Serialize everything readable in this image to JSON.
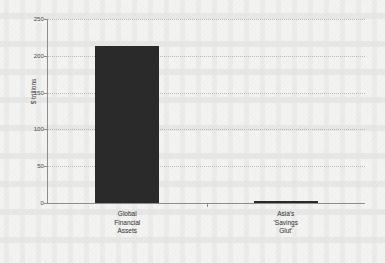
{
  "chart_data": {
    "type": "bar",
    "title": "",
    "subtitle": "",
    "xlabel": "",
    "ylabel": "$ trillions",
    "ylim": [
      0,
      250
    ],
    "yticks": [
      0,
      50,
      100,
      150,
      200,
      250
    ],
    "ytick_labels": [
      "0",
      "50",
      "100",
      "150",
      "200",
      "250"
    ],
    "grid": true,
    "grid_style": "dotted",
    "legend": false,
    "legend_position": "none",
    "categories": [
      "Global\nFinancial\nAssets",
      "Asia's\n'Savings\nGlut'"
    ],
    "category_labels_flat": [
      "Global Financial Assets",
      "Asia's 'Savings Glut'"
    ],
    "values": [
      213,
      3
    ],
    "series": [
      {
        "name": "",
        "values": [
          213,
          3
        ]
      }
    ],
    "bar_color": "#2a2a2a",
    "axis_color": "#8d8d8b",
    "grid_color": "#b9b9b7",
    "background_color": "#f4f4f2"
  }
}
